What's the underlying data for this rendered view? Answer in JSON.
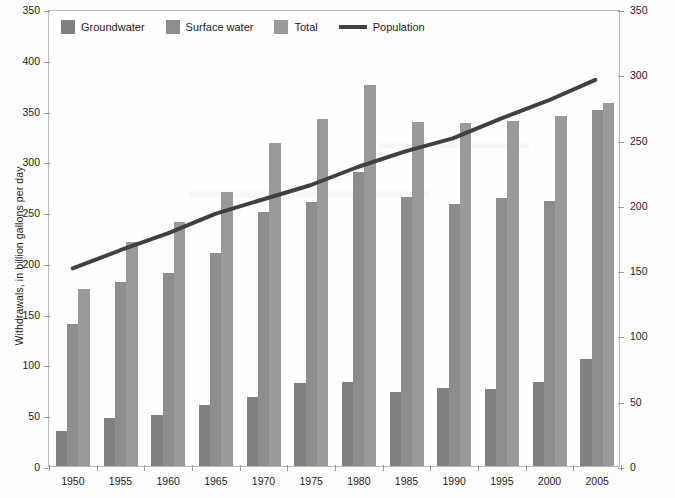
{
  "legend": {
    "items": [
      {
        "label": "Groundwater",
        "type": "swatch",
        "color": "#808080",
        "icon": "square-swatch-icon"
      },
      {
        "label": "Surface water",
        "type": "swatch",
        "color": "#8d8d8d",
        "icon": "square-swatch-icon"
      },
      {
        "label": "Total",
        "type": "swatch",
        "color": "#9a9a9a",
        "icon": "square-swatch-icon"
      },
      {
        "label": "Population",
        "type": "line",
        "color": "#404040",
        "icon": "line-swatch-icon"
      }
    ]
  },
  "axes": {
    "left": {
      "title": "Withdrawals, in billion gallons per day",
      "ticks": [
        "350",
        "400",
        "350",
        "300",
        "250",
        "200",
        "150",
        "100",
        "50",
        "0"
      ],
      "min": 0,
      "max": 450
    },
    "right": {
      "title": "Population, in millions",
      "ticks": [
        "350",
        "300",
        "250",
        "200",
        "150",
        "100",
        "50",
        "0"
      ],
      "min": 0,
      "max": 350
    },
    "x": {
      "ticks": [
        "1950",
        "1955",
        "1960",
        "1965",
        "1970",
        "1975",
        "1980",
        "1985",
        "1990",
        "1995",
        "2000",
        "2005"
      ]
    }
  },
  "chart_data": {
    "type": "bar",
    "title": "",
    "xlabel": "",
    "ylabel": "Withdrawals, in billion gallons per day",
    "y2label": "Population, in millions",
    "grid": false,
    "legend_position": "top-left",
    "ylim": [
      0,
      450
    ],
    "y2lim": [
      0,
      350
    ],
    "categories": [
      "1950",
      "1955",
      "1960",
      "1965",
      "1970",
      "1975",
      "1980",
      "1985",
      "1990",
      "1995",
      "2000",
      "2005"
    ],
    "series": [
      {
        "name": "Groundwater",
        "kind": "bar",
        "axis": "left",
        "color": "#808080",
        "values": [
          34,
          47,
          50,
          60,
          68,
          82,
          83,
          73,
          77,
          76,
          83,
          105
        ]
      },
      {
        "name": "Surface water",
        "kind": "bar",
        "axis": "left",
        "color": "#8d8d8d",
        "values": [
          140,
          181,
          190,
          210,
          250,
          260,
          290,
          265,
          258,
          264,
          261,
          351
        ]
      },
      {
        "name": "Total",
        "kind": "bar",
        "axis": "left",
        "color": "#9a9a9a",
        "values": [
          174,
          221,
          240,
          270,
          318,
          342,
          375,
          339,
          338,
          340,
          345,
          357
        ]
      },
      {
        "name": "Population",
        "kind": "line",
        "axis": "right",
        "color": "#404040",
        "values": [
          152,
          166,
          179,
          194,
          205,
          216,
          230,
          242,
          252,
          267,
          281,
          297
        ]
      }
    ]
  }
}
